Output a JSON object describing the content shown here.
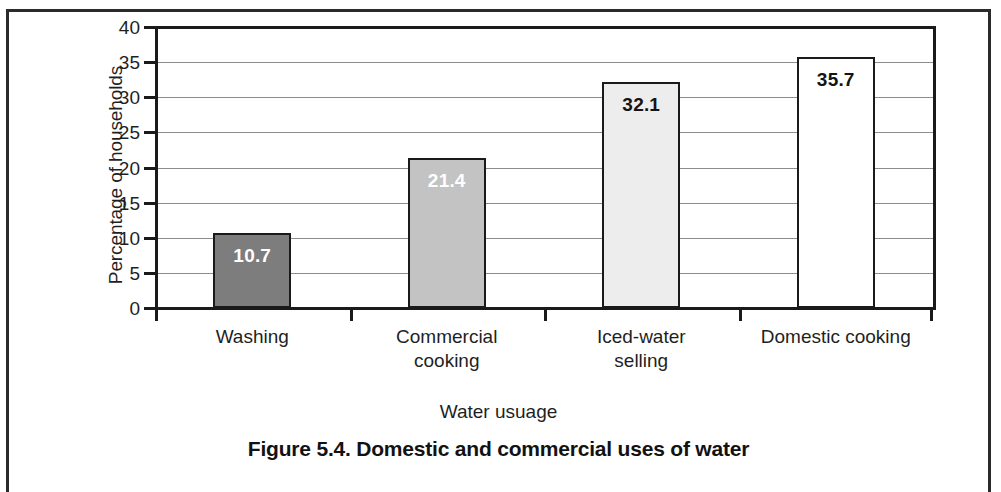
{
  "figure": {
    "caption": "Figure 5.4. Domestic and commercial uses of water"
  },
  "chart_data": {
    "type": "bar",
    "title": "Figure 5.4. Domestic and commercial uses of water",
    "xlabel": "Water usuage",
    "ylabel": "Percentage of households",
    "categories": [
      "Washing",
      "Commercial cooking",
      "Iced-water selling",
      "Domestic cooking"
    ],
    "category_lines": [
      [
        "Washing"
      ],
      [
        "Commercial",
        "cooking"
      ],
      [
        "Iced-water",
        "selling"
      ],
      [
        "Domestic cooking"
      ]
    ],
    "values": [
      10.7,
      21.4,
      32.1,
      35.7
    ],
    "value_labels": [
      "10.7",
      "21.4",
      "32.1",
      "35.7"
    ],
    "ylim": [
      0,
      40
    ],
    "ytick_labels": [
      "0",
      "5",
      "10",
      "15",
      "20",
      "25",
      "30",
      "35",
      "40"
    ],
    "ytick_values": [
      0,
      5,
      10,
      15,
      20,
      25,
      30,
      35,
      40
    ],
    "grid": true,
    "legend": false,
    "bar_colors": [
      "#7d7d7d",
      "#c3c3c3",
      "#ededed",
      "#ffffff"
    ],
    "bar_label_colors": [
      "#ffffff",
      "#ffffff",
      "#141414",
      "#141414"
    ],
    "bar_edge_color": "#1a1a1a",
    "grid_color": "#8d8d8d",
    "axis_color": "#1a1a1a"
  }
}
